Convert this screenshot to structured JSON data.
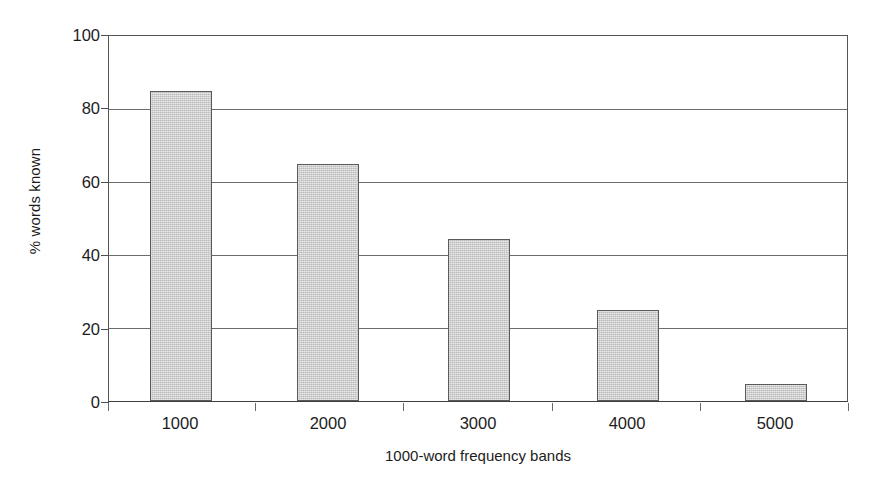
{
  "chart_data": {
    "type": "bar",
    "title": "",
    "categories": [
      "1000",
      "2000",
      "3000",
      "4000",
      "5000"
    ],
    "values": [
      85,
      65,
      44.5,
      24.8,
      4.6
    ],
    "xlabel": "1000-word frequency bands",
    "ylabel": "% words known",
    "ylim": [
      0,
      100
    ],
    "yticks": [
      0,
      20,
      40,
      60,
      80,
      100
    ],
    "ytick_labels": [
      "0",
      "20",
      "40",
      "60",
      "80",
      "100"
    ],
    "grid": true,
    "legend": false,
    "bar_color": "#cdcdcd",
    "bar_edge_color": "#5a5a5a",
    "axis_color": "#555555",
    "gridline_color": "#6b6b6b",
    "background": "#ffffff"
  }
}
